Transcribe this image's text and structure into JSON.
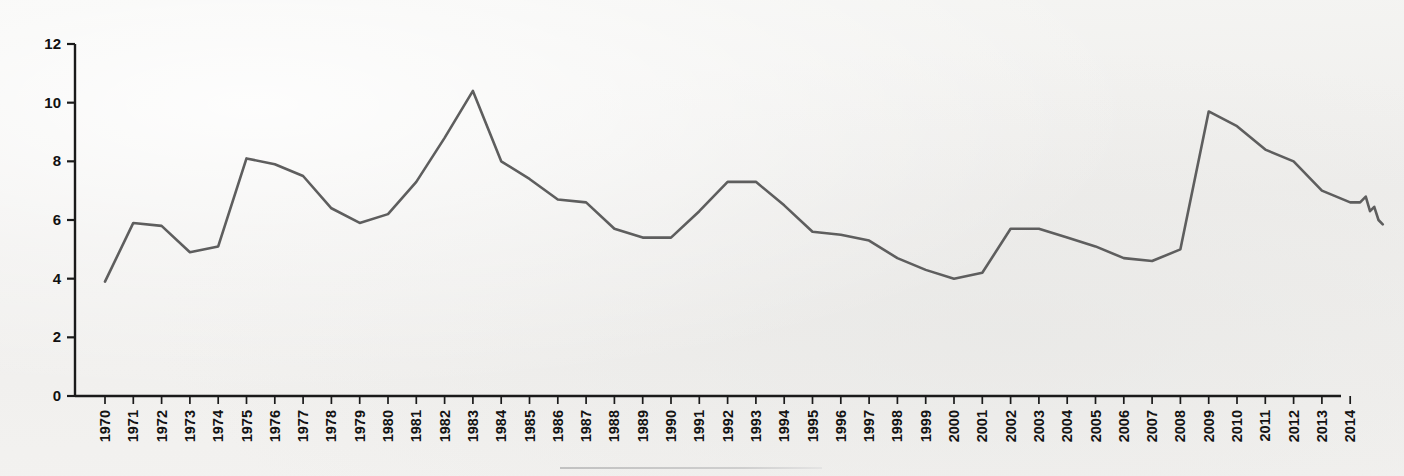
{
  "chart_data": {
    "type": "line",
    "title": "",
    "subtitle": "",
    "xlabel": "",
    "ylabel": "",
    "xlim": [
      1970,
      2015.4
    ],
    "ylim": [
      0,
      12
    ],
    "grid": false,
    "legend": null,
    "legend_position": "none",
    "line_color": "#5e5e5e",
    "axis_color": "#1a1a1a",
    "background_color": "#f2f2f0",
    "y_ticks": [
      0,
      2,
      4,
      6,
      8,
      10,
      12
    ],
    "y_tick_labels": [
      "0",
      "2",
      "4",
      "6",
      "8",
      "10",
      "12"
    ],
    "x_tick_labels": [
      "1970",
      "1971",
      "1972",
      "1973",
      "1974",
      "1975",
      "1976",
      "1977",
      "1978",
      "1979",
      "1980",
      "1981",
      "1982",
      "1983",
      "1984",
      "1985",
      "1986",
      "1987",
      "1988",
      "1989",
      "1990",
      "1991",
      "1992",
      "1993",
      "1994",
      "1995",
      "1996",
      "1997",
      "1998",
      "1999",
      "2000",
      "2001",
      "2002",
      "2003",
      "2004",
      "2005",
      "2006",
      "2007",
      "2008",
      "2009",
      "2010",
      "2011",
      "2012",
      "2013",
      "2014"
    ],
    "categories": [
      1970,
      1971,
      1972,
      1973,
      1974,
      1975,
      1976,
      1977,
      1978,
      1979,
      1980,
      1981,
      1982,
      1983,
      1984,
      1985,
      1986,
      1987,
      1988,
      1989,
      1990,
      1991,
      1992,
      1993,
      1994,
      1995,
      1996,
      1997,
      1998,
      1999,
      2000,
      2001,
      2002,
      2003,
      2004,
      2005,
      2006,
      2007,
      2008,
      2009,
      2010,
      2011,
      2012,
      2013,
      2014
    ],
    "values": [
      3.9,
      5.9,
      5.8,
      4.9,
      5.1,
      8.1,
      7.9,
      7.5,
      6.4,
      5.9,
      6.2,
      7.3,
      8.8,
      10.4,
      8.0,
      7.4,
      6.7,
      6.6,
      5.7,
      5.4,
      5.4,
      6.3,
      7.3,
      7.3,
      6.5,
      5.6,
      5.5,
      5.3,
      4.7,
      4.3,
      4.0,
      4.2,
      5.7,
      5.7,
      5.4,
      5.1,
      4.7,
      4.6,
      5.0,
      9.7,
      9.2,
      8.4,
      8.0,
      7.0,
      6.6
    ],
    "tail_points": [
      {
        "x": 2014.35,
        "y": 6.6
      },
      {
        "x": 2014.55,
        "y": 6.8
      },
      {
        "x": 2014.7,
        "y": 6.3
      },
      {
        "x": 2014.85,
        "y": 6.45
      },
      {
        "x": 2015.0,
        "y": 6.0
      },
      {
        "x": 2015.15,
        "y": 5.85
      }
    ]
  },
  "artifacts": {
    "bottom_scan_line": "faint-horizontal-scan-line"
  }
}
